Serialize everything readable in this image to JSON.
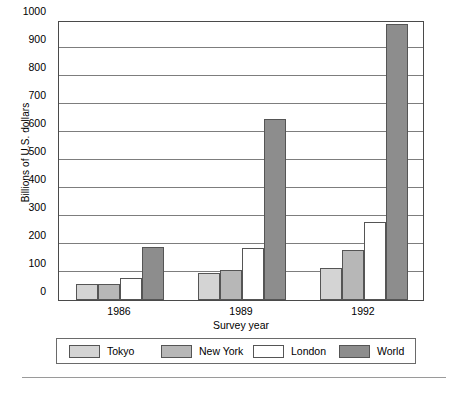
{
  "chart_data": {
    "type": "bar",
    "title": "",
    "xlabel": "Survey year",
    "ylabel": "Billions of U.S. dollars",
    "categories": [
      "1986",
      "1989",
      "1992"
    ],
    "series": [
      {
        "name": "Tokyo",
        "color": "#d4d4d4",
        "values": [
          57,
          95,
          115
        ]
      },
      {
        "name": "New York",
        "color": "#b7b7b7",
        "values": [
          57,
          108,
          178
        ]
      },
      {
        "name": "London",
        "color": "#ffffff",
        "values": [
          80,
          185,
          280
        ]
      },
      {
        "name": "World",
        "color": "#8d8d8d",
        "values": [
          190,
          645,
          985
        ]
      }
    ],
    "ylim": [
      0,
      1000
    ],
    "yticks": [
      0,
      100,
      200,
      300,
      400,
      500,
      600,
      700,
      800,
      900,
      1000
    ],
    "ytick_labels": [
      "0",
      "100",
      "200",
      "300",
      "400",
      "500",
      "600",
      "700",
      "800",
      "900",
      "1000"
    ],
    "grid": true,
    "legend_position": "bottom"
  }
}
